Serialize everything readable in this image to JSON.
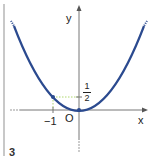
{
  "figure": {
    "panel_number": "3",
    "axis_labels": {
      "x": "x",
      "y": "y",
      "origin": "O"
    },
    "ticks": {
      "x_tick": "−1",
      "y_tick_numerator": "1",
      "y_tick_denominator": "2"
    },
    "curve": {
      "equation": "y = 1/2 x^2",
      "marked_point": [
        -1,
        0.5
      ],
      "vertex": [
        0,
        0
      ]
    },
    "colors": {
      "curve": "#2b4a8f",
      "axis": "#777777",
      "guide": "#9acd4a",
      "frame": "#c8c8c8"
    }
  }
}
